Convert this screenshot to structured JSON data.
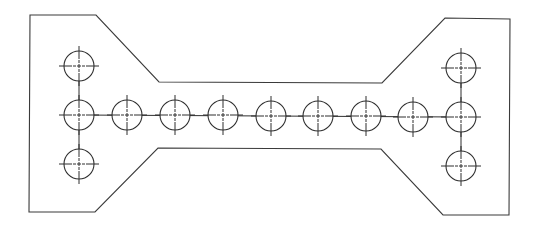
{
  "drawing": {
    "title": "Plate with bolt hole pattern",
    "width": 535,
    "height": 226,
    "line_color": "#2e2e2e",
    "outline_color": "#3a3a3a",
    "background": "#ffffff"
  },
  "outline": {
    "points": [
      [
        30,
        15
      ],
      [
        96,
        15
      ],
      [
        159,
        82
      ],
      [
        382,
        83
      ],
      [
        445,
        18
      ],
      [
        510,
        19
      ],
      [
        509,
        215
      ],
      [
        443,
        215
      ],
      [
        381,
        149
      ],
      [
        158,
        148
      ],
      [
        95,
        212
      ],
      [
        29,
        212
      ]
    ]
  },
  "hole_radius": 15,
  "holes": [
    {
      "id": "left-top",
      "cx": 79,
      "cy": 66
    },
    {
      "id": "left-middle",
      "cx": 79,
      "cy": 115
    },
    {
      "id": "left-bottom",
      "cx": 79,
      "cy": 164
    },
    {
      "id": "row-2",
      "cx": 127,
      "cy": 115
    },
    {
      "id": "row-3",
      "cx": 175,
      "cy": 115
    },
    {
      "id": "row-4",
      "cx": 223,
      "cy": 115
    },
    {
      "id": "row-5",
      "cx": 271,
      "cy": 116
    },
    {
      "id": "row-6",
      "cx": 318,
      "cy": 116
    },
    {
      "id": "row-7",
      "cx": 366,
      "cy": 116
    },
    {
      "id": "row-8",
      "cx": 413,
      "cy": 117
    },
    {
      "id": "right-top",
      "cx": 461,
      "cy": 68
    },
    {
      "id": "right-middle",
      "cx": 461,
      "cy": 117
    },
    {
      "id": "right-bottom",
      "cx": 461,
      "cy": 166
    }
  ],
  "connections": [
    [
      "left-top",
      "left-bottom"
    ],
    [
      "left-middle",
      "right-middle"
    ],
    [
      "right-top",
      "right-bottom"
    ]
  ]
}
